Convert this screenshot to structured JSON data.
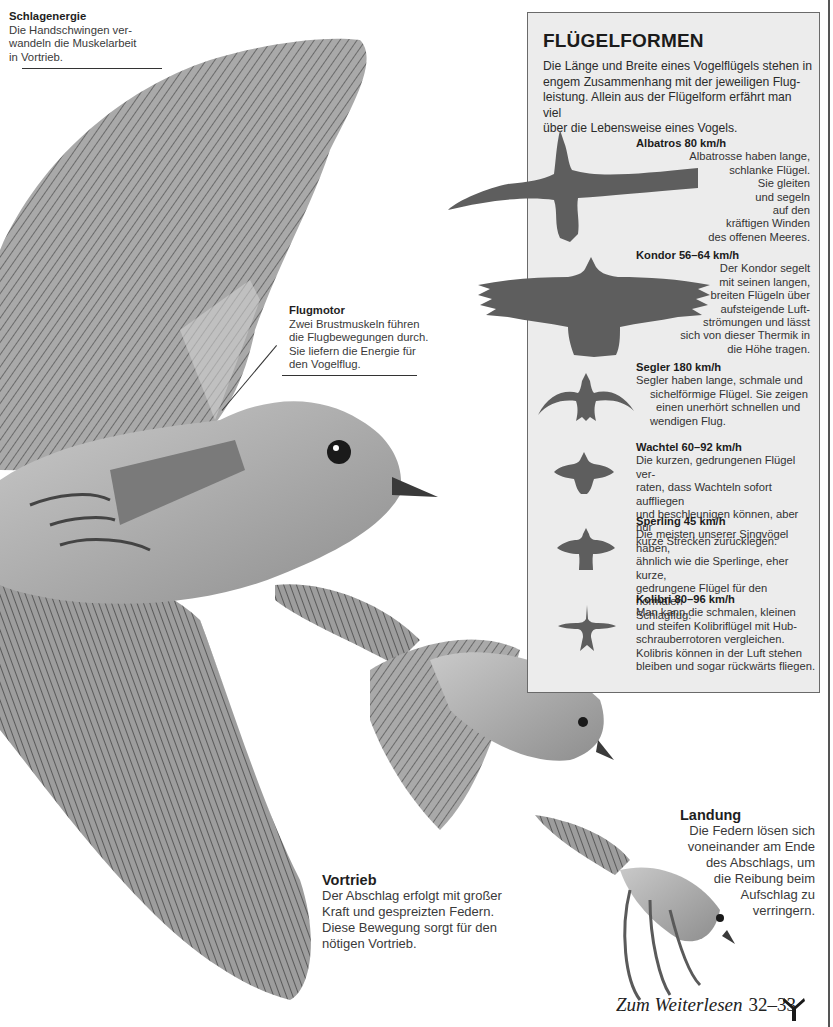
{
  "captions": {
    "schlagenergie": {
      "title": "Schlagenergie",
      "lines": [
        "Die Handschwingen ver-",
        "wandeln die Muskelarbeit",
        "in Vortrieb."
      ]
    },
    "flugmotor": {
      "title": "Flugmotor",
      "lines": [
        "Zwei Brustmuskeln führen",
        "die Flugbewegungen durch.",
        "Sie liefern die Energie für",
        "den Vogelflug."
      ]
    },
    "vortrieb": {
      "title": "Vortrieb",
      "lines": [
        "Der Abschlag erfolgt mit großer",
        "Kraft und gespreizten Federn.",
        "Diese Bewegung sorgt für den",
        "nötigen Vortrieb."
      ]
    },
    "landung": {
      "title": "Landung",
      "lines": [
        "Die Federn lösen sich",
        "voneinander am Ende",
        "des Abschlags, um",
        "die Reibung beim",
        "Aufschlag zu",
        "verringern."
      ]
    }
  },
  "info_box": {
    "title": "FLÜGELFORMEN",
    "intro_lines": [
      "Die Länge und Breite eines Vogelflügels stehen in",
      "engem Zusammenhang mit der jeweiligen Flug-",
      "leistung. Allein aus der Flügelform erfährt man viel",
      "über die Lebensweise eines Vogels."
    ],
    "entries": [
      {
        "name": "Albatros 80 km/h",
        "icon": "albatross-silhouette",
        "lines": [
          "Albatrosse haben lange,",
          "schlanke Flügel.",
          "Sie gleiten",
          "und segeln",
          "auf den",
          "kräftigen Winden",
          "des offenen Meeres."
        ]
      },
      {
        "name": "Kondor 56–64 km/h",
        "icon": "condor-silhouette",
        "lines": [
          "Der Kondor segelt",
          "mit seinen langen,",
          "breiten Flügeln über",
          "aufsteigende Luft-",
          "strömungen und lässt",
          "sich von dieser Thermik in",
          "die Höhe tragen."
        ]
      },
      {
        "name": "Segler 180 km/h",
        "icon": "swift-silhouette",
        "lines": [
          "Segler haben lange, schmale und",
          "sichelförmige Flügel. Sie zeigen",
          "einen unerhört schnellen und",
          "wendigen Flug."
        ]
      },
      {
        "name": "Wachtel 60–92 km/h",
        "icon": "quail-silhouette",
        "lines": [
          "Die kurzen, gedrungenen Flügel ver-",
          "raten, dass Wachteln sofort auffliegen",
          "und beschleunigen können, aber nur",
          "kurze Strecken zurücklegen."
        ]
      },
      {
        "name": "Sperling 45 km/h",
        "icon": "sparrow-silhouette",
        "lines": [
          "Die meisten unserer Singvögel haben,",
          "ähnlich wie die Sperlinge, eher kurze,",
          "gedrungene Flügel für den normalen",
          "Schlagflug."
        ]
      },
      {
        "name": "Kolibri 80–96 km/h",
        "icon": "hummingbird-silhouette",
        "lines": [
          "Man kann die schmalen, kleinen",
          "und steifen Kolibriflügel mit Hub-",
          "schrauberrotoren vergleichen.",
          "Kolibris können in der Luft stehen",
          "bleiben und sogar rückwärts fliegen."
        ]
      }
    ]
  },
  "footer": {
    "label": "Zum Weiterlesen",
    "pages": "32–33",
    "icon": "reference-arrow-icon"
  },
  "colors": {
    "box_bg": "#ececec",
    "silhouette": "#5e5e5e",
    "text": "#2a2a2a"
  }
}
